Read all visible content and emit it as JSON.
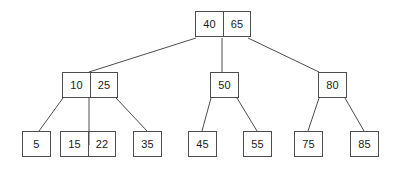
{
  "diagram": {
    "stroke_color": "#4d4d4d",
    "text_color": "#1a1a1a",
    "background_color": "#ffffff",
    "nodes": {
      "root": {
        "keys": [
          "40",
          "65"
        ]
      },
      "internal_left": {
        "keys": [
          "10",
          "25"
        ]
      },
      "internal_middle": {
        "keys": [
          "50"
        ]
      },
      "internal_right": {
        "keys": [
          "80"
        ]
      },
      "leaf_1": {
        "keys": [
          "5"
        ]
      },
      "leaf_2": {
        "keys": [
          "15",
          "22"
        ]
      },
      "leaf_3": {
        "keys": [
          "35"
        ]
      },
      "leaf_4": {
        "keys": [
          "45"
        ]
      },
      "leaf_5": {
        "keys": [
          "55"
        ]
      },
      "leaf_6": {
        "keys": [
          "75"
        ]
      },
      "leaf_7": {
        "keys": [
          "85"
        ]
      }
    },
    "edges": [
      {
        "from": "root",
        "to": "internal_left",
        "x1": 196,
        "y1": 38,
        "x2": 89,
        "y2": 72
      },
      {
        "from": "root",
        "to": "internal_middle",
        "x1": 222,
        "y1": 38,
        "x2": 222,
        "y2": 72
      },
      {
        "from": "root",
        "to": "internal_right",
        "x1": 248,
        "y1": 38,
        "x2": 319,
        "y2": 72
      },
      {
        "from": "internal_left",
        "to": "leaf_1",
        "x1": 63,
        "y1": 98,
        "x2": 39,
        "y2": 131
      },
      {
        "from": "internal_left",
        "to": "leaf_2",
        "x1": 89,
        "y1": 98,
        "x2": 89,
        "y2": 145
      },
      {
        "from": "internal_left",
        "to": "leaf_3",
        "x1": 116,
        "y1": 98,
        "x2": 147,
        "y2": 131
      },
      {
        "from": "internal_middle",
        "to": "leaf_4",
        "x1": 211,
        "y1": 98,
        "x2": 202,
        "y2": 131
      },
      {
        "from": "internal_middle",
        "to": "leaf_5",
        "x1": 237,
        "y1": 98,
        "x2": 257,
        "y2": 131
      },
      {
        "from": "internal_right",
        "to": "leaf_6",
        "x1": 319,
        "y1": 98,
        "x2": 308,
        "y2": 131
      },
      {
        "from": "internal_right",
        "to": "leaf_7",
        "x1": 345,
        "y1": 98,
        "x2": 364,
        "y2": 131
      }
    ]
  }
}
